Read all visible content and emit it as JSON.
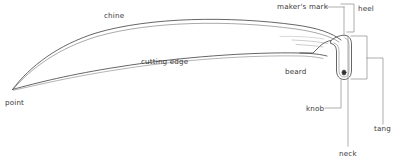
{
  "diagram": {
    "background_color": "#ffffff",
    "stroke_color": "#4a4a4a",
    "label_color": "#3a3a3a",
    "leader_color": "#8a8a8a"
  },
  "labels": {
    "chine": "chine",
    "cutting_edge": "cutting edge",
    "point": "point",
    "beard": "beard",
    "makers_mark": "maker's mark",
    "heel": "heel",
    "knob": "knob",
    "neck": "neck",
    "tang": "tang"
  },
  "label_positions": {
    "chine": {
      "x": 104,
      "y": 18
    },
    "cutting_edge": {
      "x": 141,
      "y": 64
    },
    "point": {
      "x": 5,
      "y": 105
    },
    "beard": {
      "x": 285,
      "y": 74
    },
    "makers_mark": {
      "x": 277,
      "y": 9
    },
    "heel": {
      "x": 358,
      "y": 11
    },
    "knob": {
      "x": 306,
      "y": 111
    },
    "neck": {
      "x": 339,
      "y": 156
    },
    "tang": {
      "x": 374,
      "y": 131
    }
  }
}
